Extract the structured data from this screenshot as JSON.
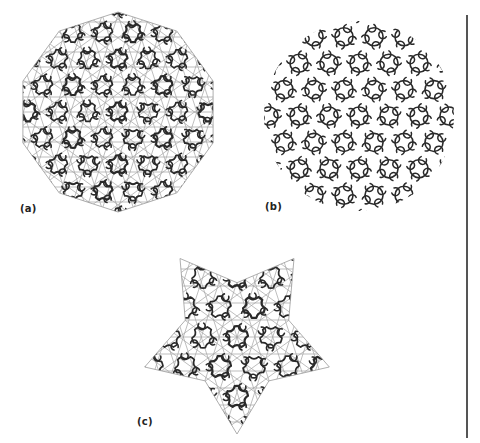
{
  "figure": {
    "panels": [
      {
        "id": "a",
        "label": "(a)",
        "shape": "decagon",
        "style": "tiling-with-guides",
        "cx": 118,
        "cy": 112,
        "r": 100
      },
      {
        "id": "b",
        "label": "(b)",
        "shape": "circle",
        "style": "curves-only",
        "cx": 359,
        "cy": 116,
        "r": 95
      },
      {
        "id": "c",
        "label": "(c)",
        "shape": "pentagram",
        "style": "tiling-with-guides",
        "cx": 237,
        "cy": 337,
        "r": 97
      }
    ],
    "colors": {
      "background": "#ffffff",
      "curve": "#2a2a2a",
      "guide": "#9a9a9a",
      "divider": "#555555",
      "label": "#222222"
    }
  }
}
